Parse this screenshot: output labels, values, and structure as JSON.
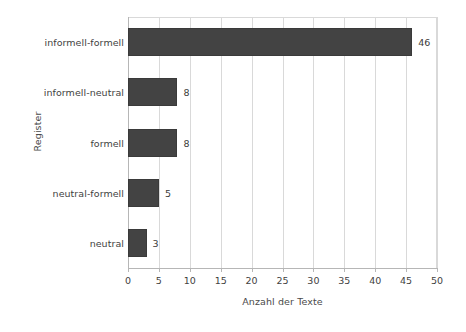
{
  "chart_data": {
    "type": "bar",
    "orientation": "horizontal",
    "title": "",
    "xlabel": "Anzahl der Texte",
    "ylabel": "Register",
    "categories": [
      "informell-formell",
      "informell-neutral",
      "formell",
      "neutral-formell",
      "neutral"
    ],
    "values": [
      46,
      8,
      8,
      5,
      3
    ],
    "value_labels": [
      "46",
      "8",
      "8",
      "5",
      "3"
    ],
    "xlim": [
      0,
      50
    ],
    "xticks": [
      0,
      5,
      10,
      15,
      20,
      25,
      30,
      35,
      40,
      45,
      50
    ],
    "xtick_labels": [
      "0",
      "5",
      "10",
      "15",
      "20",
      "25",
      "30",
      "35",
      "40",
      "45",
      "50"
    ],
    "grid": "vertical",
    "legend": "none",
    "bar_color": "#434343",
    "grid_color": "#d9d9d9",
    "axis_color": "#b6b6b6",
    "background": "#ffffff"
  }
}
